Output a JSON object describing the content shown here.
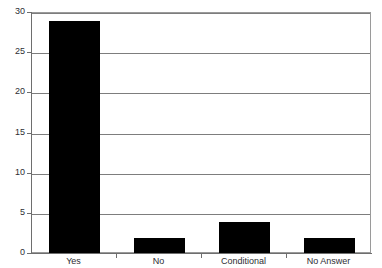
{
  "chart_data": {
    "type": "bar",
    "title": "",
    "title_cropped": true,
    "xlabel": "",
    "ylabel": "",
    "categories": [
      "Yes",
      "No",
      "Conditional",
      "No Answer"
    ],
    "values": [
      29,
      2,
      4,
      2
    ],
    "ylim": [
      0,
      30
    ],
    "yticks": [
      0,
      5,
      10,
      15,
      20,
      25,
      30
    ],
    "ytick_labels": [
      "0",
      "5",
      "10",
      "15",
      "20",
      "25",
      "30"
    ],
    "grid": true,
    "grid_axis": "y",
    "legend": false,
    "bar_color": "#000000",
    "grid_color": "#7d7d7d",
    "axis_color": "#6e6e6e",
    "background_color": "#ffffff"
  },
  "axis": {
    "y_labels": [
      "30",
      "25",
      "20",
      "15",
      "10",
      "5",
      "0"
    ],
    "x_labels": [
      "Yes",
      "No",
      "Conditional",
      "No Answer"
    ]
  }
}
